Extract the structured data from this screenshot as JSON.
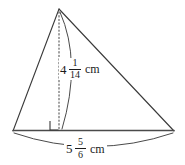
{
  "figure": {
    "type": "triangle-with-altitude",
    "background_color": "#ffffff",
    "stroke_color": "#3a3a3a",
    "text_color": "#1b1b1b",
    "geometry": {
      "apex": [
        59,
        9
      ],
      "bottom_left": [
        13,
        131
      ],
      "bottom_right": [
        174,
        131
      ],
      "altitude_foot": [
        59,
        130
      ],
      "right_angle_marker": [
        50,
        121
      ]
    },
    "height_label": {
      "whole": "4",
      "numerator": "1",
      "denominator": "14",
      "unit": "cm",
      "full_text": "4 1/14 cm"
    },
    "base_label": {
      "whole": "5",
      "numerator": "5",
      "denominator": "6",
      "unit": "cm",
      "full_text": "5 5/6 cm"
    }
  }
}
